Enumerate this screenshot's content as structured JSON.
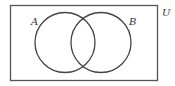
{
  "diagram": {
    "type": "venn",
    "universe_label": "U",
    "sets": [
      {
        "label": "A"
      },
      {
        "label": "B"
      }
    ],
    "stroke_color": "#444444"
  }
}
